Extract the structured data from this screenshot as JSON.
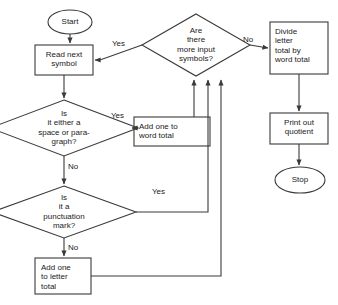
{
  "diagram": {
    "type": "flowchart",
    "nodes": [
      {
        "id": "start",
        "shape": "terminator",
        "text": "Start",
        "x": 70,
        "y": 22
      },
      {
        "id": "read",
        "shape": "process",
        "text": "Read next\nsymbol",
        "x": 64,
        "y": 60
      },
      {
        "id": "space_test",
        "shape": "decision",
        "text": "Is\nit either a\nspace or para-\ngraph?",
        "x": 64,
        "y": 128
      },
      {
        "id": "punct_test",
        "shape": "decision",
        "text": "Is\nit a\npunctuation\nmark?",
        "x": 64,
        "y": 212
      },
      {
        "id": "add_letter",
        "shape": "process",
        "text": "Add one\nto letter\ntotal",
        "x": 64,
        "y": 276
      },
      {
        "id": "add_word",
        "shape": "process",
        "text": "Add one to\nword total",
        "x": 172,
        "y": 131
      },
      {
        "id": "more_input",
        "shape": "decision",
        "text": "Are\nthere\nmore input\nsymbols?",
        "x": 196,
        "y": 45
      },
      {
        "id": "divide",
        "shape": "process",
        "text": "Divide\nletter\ntotal by\nword total",
        "x": 298,
        "y": 48
      },
      {
        "id": "print",
        "shape": "process",
        "text": "Print out\nquotient",
        "x": 298,
        "y": 128
      },
      {
        "id": "stop",
        "shape": "terminator",
        "text": "Stop",
        "x": 300,
        "y": 180
      }
    ],
    "edge_labels": [
      {
        "id": "yes_more_input",
        "text": "Yes",
        "x": 118,
        "y": 44
      },
      {
        "id": "no_more_input",
        "text": "No",
        "x": 247,
        "y": 40
      },
      {
        "id": "yes_space",
        "text": "Yes",
        "x": 117,
        "y": 116
      },
      {
        "id": "no_space",
        "text": "No",
        "x": 70,
        "y": 166
      },
      {
        "id": "yes_punct",
        "text": "Yes",
        "x": 158,
        "y": 192
      },
      {
        "id": "no_punct",
        "text": "No",
        "x": 70,
        "y": 247
      }
    ],
    "colors": {
      "stroke": "#3a3a3a",
      "text": "#222222",
      "background": "#ffffff"
    }
  }
}
